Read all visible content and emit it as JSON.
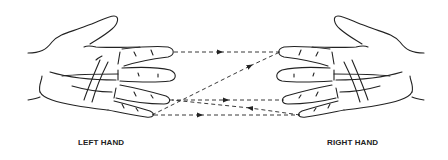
{
  "diagram": {
    "labels": {
      "left_hand": "LEFT HAND",
      "right_hand": "RIGHT HAND"
    },
    "colors": {
      "stroke": "#222222",
      "background": "#ffffff"
    },
    "connections": [
      {
        "from": "left-index",
        "to": "right-index",
        "arrow": "right"
      },
      {
        "from": "left-pinky",
        "to": "right-index",
        "arrow": "toward-right-index"
      },
      {
        "from": "left-ring",
        "to": "right-ring",
        "arrow": "right"
      },
      {
        "from": "right-pinky",
        "to": "left-ring",
        "arrow": "left"
      },
      {
        "from": "left-pinky",
        "to": "right-pinky",
        "arrow": "right"
      }
    ]
  }
}
